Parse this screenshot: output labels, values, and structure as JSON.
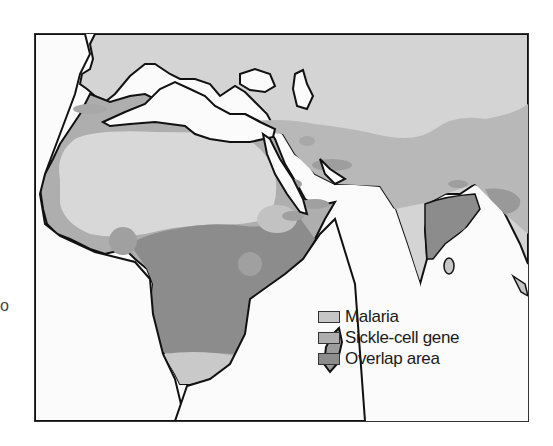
{
  "stray_text": "o",
  "map": {
    "region": "Africa, Southern Europe, Middle East and South Asia",
    "colors": {
      "water": "#fbfbfb",
      "no_data_land": "#d4d4d4",
      "malaria": "#c6c6c6",
      "sickle_cell": "#aeaeae",
      "overlap": "#8c8c8c",
      "coastline": "#111111"
    }
  },
  "legend": {
    "items": [
      {
        "label": "Malaria",
        "color": "#c6c6c6"
      },
      {
        "label": "Sickle-cell gene",
        "color": "#aeaeae"
      },
      {
        "label": "Overlap area",
        "color": "#8c8c8c"
      }
    ]
  }
}
